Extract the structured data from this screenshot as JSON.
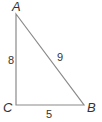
{
  "diagram": {
    "type": "right-triangle",
    "line_color": "#8a8a8a",
    "text_color": "#333333",
    "vertices": {
      "A": {
        "label": "A",
        "x": 16,
        "y": 14
      },
      "B": {
        "label": "B",
        "x": 84,
        "y": 105
      },
      "C": {
        "label": "C",
        "x": 16,
        "y": 105
      }
    },
    "sides": {
      "AC": {
        "label": "8"
      },
      "AB": {
        "label": "9"
      },
      "CB": {
        "label": "5"
      }
    }
  }
}
